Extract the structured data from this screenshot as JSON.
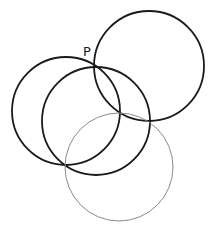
{
  "diagram": {
    "type": "geometry-circles",
    "point_label": {
      "text": "P",
      "x": 83,
      "y": 56
    },
    "intersection_point": {
      "x": 95,
      "y": 67
    },
    "circles": [
      {
        "id": "circle-top-right",
        "cx": 149,
        "cy": 66,
        "r": 55,
        "stroke": "#1a1a1a",
        "width": 1.8
      },
      {
        "id": "circle-left",
        "cx": 66,
        "cy": 111,
        "r": 54,
        "stroke": "#1a1a1a",
        "width": 1.8
      },
      {
        "id": "circle-middle",
        "cx": 96,
        "cy": 121,
        "r": 54,
        "stroke": "#1a1a1a",
        "width": 1.8
      },
      {
        "id": "circle-bottom-gray",
        "cx": 119,
        "cy": 167,
        "r": 54,
        "stroke": "#8a8a8a",
        "width": 1.0
      }
    ]
  }
}
